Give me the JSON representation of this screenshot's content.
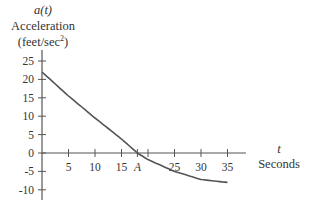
{
  "chart_data": {
    "type": "line",
    "title": "",
    "ylabel_var": "a(t)",
    "ylabel": "Acceleration",
    "yunits": "(feet/sec²)",
    "xlabel_var": "t",
    "xlabel": "Seconds",
    "xlim": [
      0,
      38
    ],
    "ylim": [
      -12,
      28
    ],
    "x_ticks": [
      "5",
      "10",
      "15",
      "A",
      "25",
      "30",
      "35"
    ],
    "x_tick_values": [
      5,
      10,
      15,
      18,
      25,
      30,
      35
    ],
    "y_ticks": [
      "25",
      "20",
      "15",
      "10",
      "5",
      "0",
      "-5",
      "-10"
    ],
    "y_tick_values": [
      25,
      20,
      15,
      10,
      5,
      0,
      -5,
      -10
    ],
    "annotations": [
      {
        "label": "A",
        "x": 18,
        "note": "zero crossing of a(t)"
      }
    ],
    "grid": false,
    "series": [
      {
        "name": "a(t)",
        "x": [
          0,
          5,
          10,
          15,
          18,
          20,
          25,
          30,
          35
        ],
        "values": [
          22,
          15.5,
          9.5,
          3.8,
          0,
          -1.8,
          -5,
          -7.2,
          -8
        ]
      }
    ]
  },
  "labels": {
    "y_var": "a(t)",
    "y_name": "Acceleration",
    "y_units_prefix": "(feet/sec",
    "y_units_exp": "2",
    "y_units_suffix": ")",
    "x_var": "t",
    "x_name": "Seconds"
  }
}
